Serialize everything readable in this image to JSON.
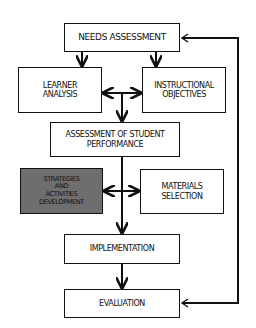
{
  "diagram": {
    "nodes": [
      {
        "id": "needs",
        "label": "NEEDS ASSESSMENT"
      },
      {
        "id": "learner",
        "label": "LEARNER\nANALYSIS"
      },
      {
        "id": "objectives",
        "label": "INSTRUCTIONAL\nOBJECTIVES"
      },
      {
        "id": "assessment",
        "label": "ASSESSMENT OF STUDENT\nPERFORMANCE"
      },
      {
        "id": "strategies",
        "label": "STRATEGIES\nAND\nACTIVITIES\nDEVELOPMENT",
        "fill": "#6e6e6e"
      },
      {
        "id": "materials",
        "label": "MATERIALS\nSELECTION"
      },
      {
        "id": "implementation",
        "label": "IMPLEMENTATION"
      },
      {
        "id": "evaluation",
        "label": "EVALUATION"
      }
    ],
    "edges": [
      {
        "from": "needs",
        "to": "learner"
      },
      {
        "from": "needs",
        "to": "objectives"
      },
      {
        "from": "learner",
        "to": "objectives",
        "bidirectional": true
      },
      {
        "from": "learner/objectives",
        "to": "assessment"
      },
      {
        "from": "assessment",
        "to": "strategies"
      },
      {
        "from": "assessment",
        "to": "materials"
      },
      {
        "from": "strategies/materials",
        "to": "implementation"
      },
      {
        "from": "implementation",
        "to": "evaluation"
      },
      {
        "from": "feedback-loop",
        "to": "needs"
      },
      {
        "from": "feedback-loop",
        "to": "evaluation"
      }
    ]
  }
}
